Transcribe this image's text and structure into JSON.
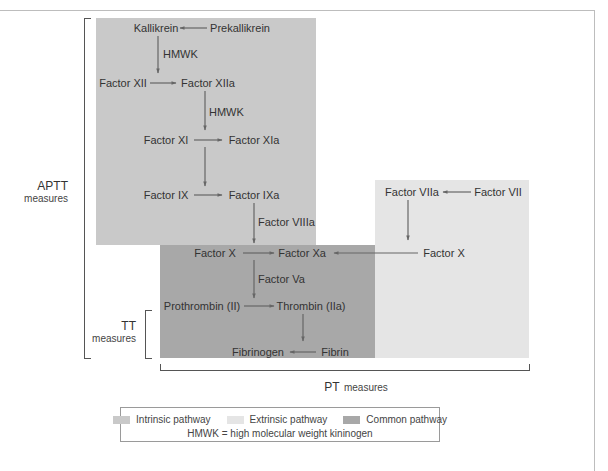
{
  "colors": {
    "intrinsic": "#c9c9c9",
    "extrinsic": "#e5e5e5",
    "common": "#a8a8a8",
    "arrow": "#666666",
    "text": "#333333"
  },
  "nodes": {
    "kallikrein": "Kallikrein",
    "prekallikrein": "Prekallikrein",
    "hmwk_1": "HMWK",
    "factor_xii": "Factor XII",
    "factor_xiia": "Factor XIIa",
    "hmwk_2": "HMWK",
    "factor_xi": "Factor XI",
    "factor_xia": "Factor XIa",
    "factor_ix": "Factor IX",
    "factor_ixa": "Factor IXa",
    "factor_viiia": "Factor VIIIa",
    "factor_viia": "Factor VIIa",
    "factor_vii": "Factor VII",
    "factor_x_common": "Factor X",
    "factor_xa": "Factor Xa",
    "factor_x_extrinsic": "Factor X",
    "factor_va": "Factor Va",
    "prothrombin": "Prothrombin (II)",
    "thrombin": "Thrombin (IIa)",
    "fibrinogen": "Fibrinogen",
    "fibrin": "Fibrin"
  },
  "measures": {
    "aptt": {
      "abbr": "APTT",
      "word": "measures"
    },
    "tt": {
      "abbr": "TT",
      "word": "measures"
    },
    "pt": {
      "abbr": "PT",
      "word": "measures"
    }
  },
  "legend": {
    "items": [
      {
        "label": "Intrinsic pathway",
        "color": "#c9c9c9"
      },
      {
        "label": "Extrinsic pathway",
        "color": "#e5e5e5"
      },
      {
        "label": "Common pathway",
        "color": "#a8a8a8"
      }
    ],
    "note": "HMWK = high molecular weight kininogen"
  },
  "edges": [
    {
      "from": "Prekallikrein",
      "to": "Kallikrein"
    },
    {
      "from": "Kallikrein",
      "to": "Factor XII→XIIa",
      "label": "HMWK"
    },
    {
      "from": "Factor XII",
      "to": "Factor XIIa"
    },
    {
      "from": "Factor XIIa",
      "to": "Factor XI→XIa",
      "label": "HMWK"
    },
    {
      "from": "Factor XI",
      "to": "Factor XIa"
    },
    {
      "from": "Factor XIa",
      "to": "Factor IX→IXa"
    },
    {
      "from": "Factor IX",
      "to": "Factor IXa"
    },
    {
      "from": "Factor IXa",
      "to": "Factor X→Xa",
      "label": "Factor VIIIa"
    },
    {
      "from": "Factor VII",
      "to": "Factor VIIa"
    },
    {
      "from": "Factor VIIa",
      "to": "Factor X (extrinsic)"
    },
    {
      "from": "Factor X (extrinsic)",
      "to": "Factor Xa"
    },
    {
      "from": "Factor X",
      "to": "Factor Xa"
    },
    {
      "from": "Factor Xa",
      "to": "Prothrombin→Thrombin",
      "label": "Factor Va"
    },
    {
      "from": "Prothrombin (II)",
      "to": "Thrombin (IIa)"
    },
    {
      "from": "Thrombin (IIa)",
      "to": "Fibrin"
    },
    {
      "from": "Fibrin",
      "to": "Fibrinogen"
    }
  ]
}
